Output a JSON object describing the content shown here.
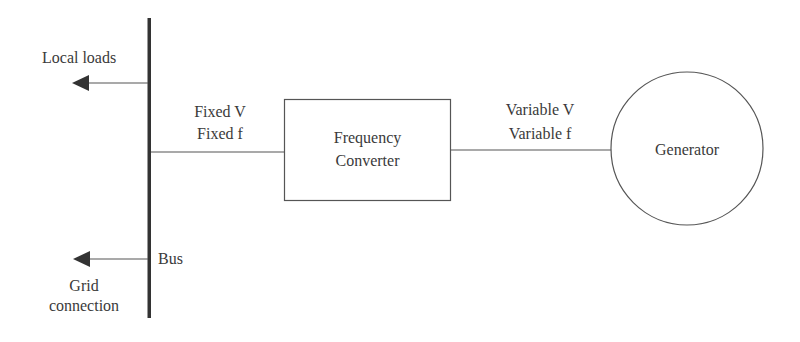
{
  "diagram": {
    "type": "power-system-block-diagram",
    "colors": {
      "line": "#555555",
      "bus": "#333333",
      "text": "#3a3a3a",
      "background": "#ffffff"
    },
    "bus": {
      "label": "Bus"
    },
    "outputs": {
      "local_loads": "Local loads",
      "grid_connection_line1": "Grid",
      "grid_connection_line2": "connection"
    },
    "bus_side_link": {
      "line1": "Fixed V",
      "line2": "Fixed f"
    },
    "converter": {
      "line1": "Frequency",
      "line2": "Converter"
    },
    "generator_side_link": {
      "line1": "Variable V",
      "line2": "Variable f"
    },
    "generator": {
      "label": "Generator"
    }
  }
}
